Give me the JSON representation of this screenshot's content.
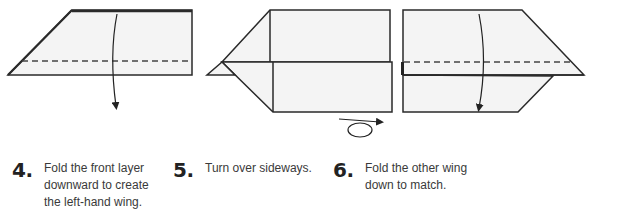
{
  "steps": [
    {
      "number": "4.",
      "text": "Fold the front layer downward to create the left-hand wing."
    },
    {
      "number": "5.",
      "text": "Turn over sideways."
    },
    {
      "number": "6.",
      "text": "Fold the other wing down to match."
    }
  ],
  "diagrams": [
    {
      "step": 4,
      "icons": [
        "fold-down-arrow-icon",
        "valley-fold-dashed-line"
      ]
    },
    {
      "step": 5,
      "icons": [
        "turn-over-sideways-icon"
      ]
    },
    {
      "step": 6,
      "icons": [
        "fold-down-arrow-icon",
        "valley-fold-dashed-line"
      ]
    }
  ],
  "colors": {
    "paper": "#f4f4f4",
    "line": "#2a2a2a",
    "dash": "#555555"
  }
}
